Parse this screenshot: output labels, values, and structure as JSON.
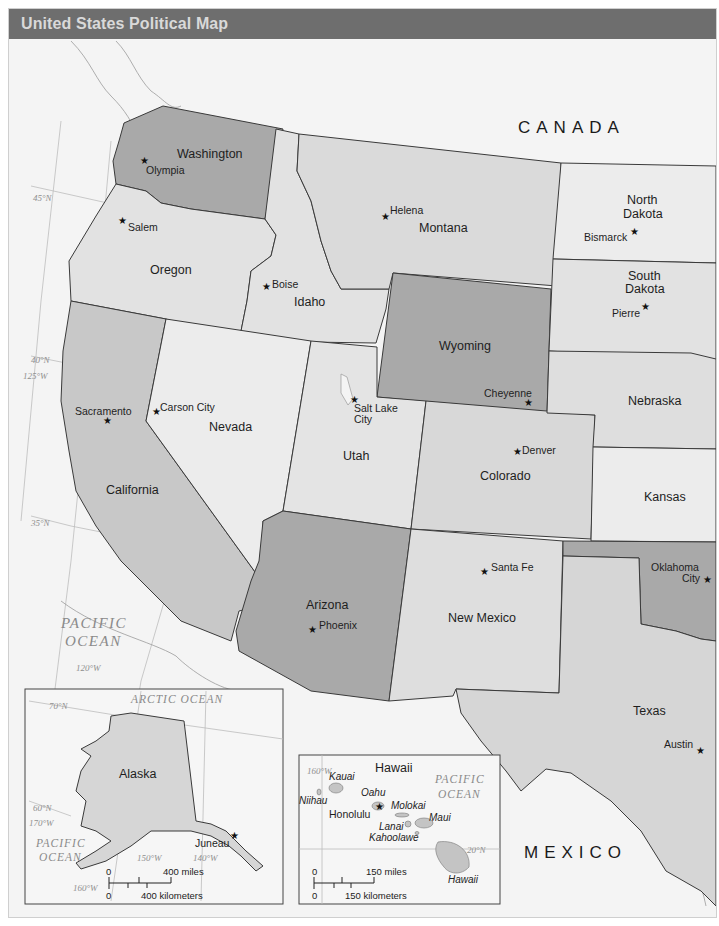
{
  "map": {
    "title": "United States Political Map",
    "colors": {
      "title_bar": "#6e6e6e",
      "title_text": "#d9d9d9",
      "background": "#f4f4f4",
      "light_state": "#e2e2e2",
      "lighter_state": "#ececec",
      "medium_state": "#d3d3d3",
      "dark_state": "#a9a9a9",
      "border": "#3a3a3a"
    },
    "countries": [
      {
        "name": "CANADA"
      },
      {
        "name": "MEXICO"
      }
    ],
    "oceans": {
      "pacific_main": {
        "line1": "PACIFIC",
        "line2": "OCEAN"
      }
    },
    "graticule_labels": {
      "lat_45": "45°N",
      "lat_40": "40°N",
      "lon_125": "125°W",
      "lat_35": "35°N",
      "lon_120": "120°W"
    },
    "states": [
      {
        "name": "Washington",
        "capital": "Olympia"
      },
      {
        "name": "Oregon",
        "capital": "Salem"
      },
      {
        "name": "California",
        "capital": "Sacramento"
      },
      {
        "name": "Idaho",
        "capital": "Boise"
      },
      {
        "name": "Nevada",
        "capital": "Carson City"
      },
      {
        "name": "Montana",
        "capital": "Helena"
      },
      {
        "name": "Wyoming",
        "capital": "Cheyenne"
      },
      {
        "name": "Utah",
        "capital": "Salt Lake City",
        "capital_line1": "Salt Lake",
        "capital_line2": "City"
      },
      {
        "name": "Colorado",
        "capital": "Denver"
      },
      {
        "name": "Arizona",
        "capital": "Phoenix"
      },
      {
        "name": "New Mexico",
        "capital": "Santa Fe"
      },
      {
        "name": "North Dakota",
        "name_line1": "North",
        "name_line2": "Dakota",
        "capital": "Bismarck"
      },
      {
        "name": "South Dakota",
        "name_line1": "South",
        "name_line2": "Dakota",
        "capital": "Pierre"
      },
      {
        "name": "Nebraska"
      },
      {
        "name": "Kansas"
      },
      {
        "name": "Oklahoma",
        "capital": "Oklahoma City",
        "capital_line1": "Oklahoma",
        "capital_line2": "City"
      },
      {
        "name": "Texas",
        "capital": "Austin"
      }
    ],
    "alaska_inset": {
      "state": "Alaska",
      "capital": "Juneau",
      "ocean_top": "ARCTIC OCEAN",
      "ocean_bottom": {
        "line1": "PACIFIC",
        "line2": "OCEAN"
      },
      "graticule_labels": {
        "lat_70": "70°N",
        "lat_60": "60°N",
        "lon_170": "170°W",
        "lon_160": "160°W",
        "lon_150": "150°W",
        "lon_140": "140°W"
      },
      "scale": {
        "zero_top": "0",
        "miles": "400 miles",
        "zero_bottom": "0",
        "km": "400 kilometers"
      }
    },
    "hawaii_inset": {
      "state": "Hawaii",
      "capital": "Honolulu",
      "ocean": {
        "line1": "PACIFIC",
        "line2": "OCEAN"
      },
      "islands": [
        "Kauai",
        "Niihau",
        "Oahu",
        "Molokai",
        "Maui",
        "Lanai",
        "Kahoolawe",
        "Hawaii"
      ],
      "graticule_labels": {
        "lon_160": "160°W",
        "lat_20": "20°N"
      },
      "scale": {
        "zero_top": "0",
        "miles": "150 miles",
        "zero_bottom": "0",
        "km": "150 kilometers"
      }
    },
    "capital_symbol": "★"
  }
}
